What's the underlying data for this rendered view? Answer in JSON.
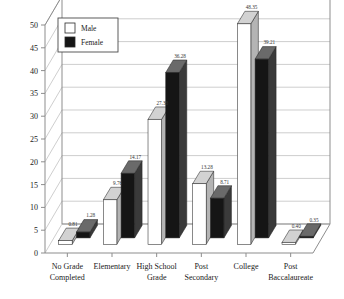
{
  "chart_data": {
    "type": "bar",
    "title": "",
    "xlabel": "",
    "ylabel": "",
    "ylim": [
      0,
      50
    ],
    "ytick_step": 5,
    "yticks": [
      "0",
      "5",
      "10",
      "15",
      "20",
      "25",
      "30",
      "35",
      "40",
      "45",
      "50"
    ],
    "grid": true,
    "legend_position": "top-left",
    "style": "3d-column",
    "categories": [
      "No Grade Completed",
      "Elementary",
      "High School Grade",
      "Post Secondary",
      "College",
      "Post Baccalaureate"
    ],
    "category_lines": [
      [
        "No Grade",
        "Completed"
      ],
      [
        "Elementary",
        ""
      ],
      [
        "High School",
        "Grade"
      ],
      [
        "Post",
        "Secondary"
      ],
      [
        "College",
        ""
      ],
      [
        "Post",
        "Baccalaureate"
      ]
    ],
    "series": [
      {
        "name": "Male",
        "color": "#ffffff",
        "values": [
          0.81,
          9.76,
          27.38,
          13.28,
          48.35,
          0.4
        ],
        "labels": [
          "0.81",
          "9.76",
          "27.38",
          "13.28",
          "48.35",
          "0.40"
        ]
      },
      {
        "name": "Female",
        "color": "#151515",
        "values": [
          1.28,
          14.17,
          36.28,
          8.71,
          39.21,
          0.35
        ],
        "labels": [
          "1.28",
          "14.17",
          "36.28",
          "8.71",
          "39.21",
          "0.35"
        ]
      }
    ]
  },
  "legend": {
    "items": [
      {
        "label": "Male",
        "swatch": "#ffffff"
      },
      {
        "label": "Female",
        "swatch": "#151515"
      }
    ]
  },
  "colors": {
    "male_face": "#ffffff",
    "male_top": "#d2d2d2",
    "male_side": "#b4b4b4",
    "female_face": "#151515",
    "female_top": "#6a6a6a",
    "female_side": "#3a3a3a",
    "grid": "#b9b9b9",
    "axis": "#8d8d8d",
    "text": "#1a1a1a",
    "background": "#ffffff"
  }
}
